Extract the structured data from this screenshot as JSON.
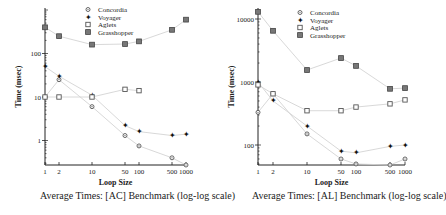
{
  "chart_data": [
    {
      "type": "line",
      "title": "Average Times: [AC] Benchmark (log-log scale)",
      "xlabel": "Loop Size",
      "ylabel": "Time (msec)",
      "xscale": "log",
      "yscale": "log",
      "x": [
        1,
        2,
        10,
        50,
        100,
        500,
        1000
      ],
      "x_tick_labels": [
        "1",
        "2",
        "10",
        "50",
        "100",
        "500",
        "1000"
      ],
      "y_tick_labels": [
        "1",
        "10",
        "100"
      ],
      "ylim": [
        0.25,
        700
      ],
      "grid": false,
      "legend_position": "top-center",
      "series": [
        {
          "name": "Concordia",
          "marker": "circle",
          "values": [
            10,
            25,
            6,
            1.3,
            0.75,
            0.4,
            0.25
          ]
        },
        {
          "name": "Voyager",
          "marker": "star",
          "values": [
            50,
            30,
            11,
            2.2,
            1.6,
            1.3,
            1.4
          ]
        },
        {
          "name": "Aglets",
          "marker": "open-square",
          "values": [
            10,
            10,
            10,
            15,
            14,
            null,
            null
          ]
        },
        {
          "name": "Grasshopper",
          "marker": "filled-square",
          "values": [
            400,
            250,
            160,
            165,
            190,
            350,
            600
          ]
        }
      ]
    },
    {
      "type": "line",
      "title": "Average Times: [AL] Benchmark (log-log scale)",
      "xlabel": "Loop Size",
      "ylabel": "Time (msec)",
      "xscale": "log",
      "yscale": "log",
      "x": [
        1,
        2,
        10,
        50,
        100,
        500,
        1000
      ],
      "x_tick_labels": [
        "1",
        "2",
        "10",
        "50",
        "100",
        "500",
        "1000"
      ],
      "y_tick_labels": [
        "100",
        "1000",
        "10000"
      ],
      "ylim": [
        45,
        14000
      ],
      "grid": false,
      "legend_position": "top-center",
      "series": [
        {
          "name": "Concordia",
          "marker": "circle",
          "values": [
            330,
            650,
            150,
            60,
            50,
            45,
            60
          ]
        },
        {
          "name": "Voyager",
          "marker": "star",
          "values": [
            1000,
            500,
            200,
            80,
            75,
            95,
            100
          ]
        },
        {
          "name": "Aglets",
          "marker": "open-square",
          "values": [
            900,
            650,
            350,
            350,
            400,
            450,
            520
          ]
        },
        {
          "name": "Grasshopper",
          "marker": "filled-square",
          "values": [
            13000,
            6500,
            1550,
            2400,
            1800,
            780,
            800
          ]
        }
      ]
    }
  ]
}
